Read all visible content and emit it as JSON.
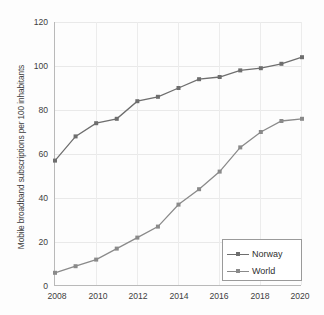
{
  "chart_data": {
    "type": "line",
    "title": "",
    "xlabel": "",
    "ylabel": "Mobile broadband subscriptions per 100 inhabitants",
    "x": [
      2008,
      2009,
      2010,
      2011,
      2012,
      2013,
      2014,
      2015,
      2016,
      2017,
      2018,
      2019,
      2020
    ],
    "xtick_labels": [
      "2008",
      "2010",
      "2012",
      "2014",
      "2016",
      "2018",
      "2020"
    ],
    "xtick_values": [
      2008,
      2010,
      2012,
      2014,
      2016,
      2018,
      2020
    ],
    "ytick_labels": [
      "0",
      "20",
      "40",
      "60",
      "80",
      "100",
      "120"
    ],
    "ytick_values": [
      0,
      20,
      40,
      60,
      80,
      100,
      120
    ],
    "xlim": [
      2008,
      2020
    ],
    "ylim": [
      0,
      120
    ],
    "grid": true,
    "legend_position": "lower right",
    "series": [
      {
        "name": "Norway",
        "marker": "square",
        "color": "#6e6e6e",
        "values": [
          57,
          68,
          74,
          76,
          84,
          86,
          90,
          94,
          95,
          98,
          99,
          101,
          104
        ]
      },
      {
        "name": "World",
        "marker": "square",
        "color": "#8a8a8a",
        "values": [
          6,
          9,
          12,
          17,
          22,
          27,
          37,
          44,
          52,
          63,
          70,
          75,
          76
        ]
      }
    ]
  }
}
